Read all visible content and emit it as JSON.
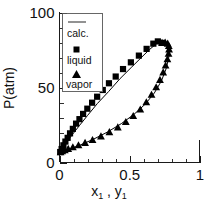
{
  "chart_data": {
    "type": "scatter",
    "title": "",
    "xlabel": "x₁ , y₁",
    "ylabel": "P(atm)",
    "xlim": [
      0,
      1
    ],
    "ylim": [
      0,
      100
    ],
    "xticks": [
      0,
      0.5,
      1
    ],
    "xtick_labels": [
      "0",
      "0.5",
      "1"
    ],
    "yticks": [
      0,
      50,
      100
    ],
    "ytick_labels": [
      "0",
      "50",
      "100"
    ],
    "x_minor_step": 0.1,
    "y_minor_step": 10,
    "grid": false,
    "legend_position": "upper-left-inside",
    "legend_entries": [
      {
        "label": "calc.",
        "marker": "line"
      },
      {
        "label": "liquid",
        "marker": "square"
      },
      {
        "label": "vapor",
        "marker": "triangle"
      }
    ],
    "series": [
      {
        "name": "liquid",
        "marker": "square",
        "x": [
          0.005,
          0.015,
          0.028,
          0.042,
          0.058,
          0.075,
          0.095,
          0.118,
          0.142,
          0.168,
          0.198,
          0.232,
          0.268,
          0.308,
          0.352,
          0.4,
          0.452,
          0.508,
          0.565,
          0.62,
          0.668,
          0.7,
          0.728
        ],
        "y": [
          7.0,
          9.0,
          11.5,
          14.0,
          16.5,
          19.5,
          22.5,
          26.0,
          29.0,
          32.5,
          36.0,
          40.0,
          44.0,
          48.5,
          53.0,
          57.5,
          62.5,
          67.0,
          71.5,
          76.0,
          79.5,
          81.0,
          80.0
        ]
      },
      {
        "name": "vapor",
        "marker": "triangle",
        "x": [
          0.008,
          0.02,
          0.038,
          0.062,
          0.095,
          0.135,
          0.182,
          0.235,
          0.295,
          0.355,
          0.415,
          0.472,
          0.525,
          0.575,
          0.618,
          0.655,
          0.688,
          0.715,
          0.738,
          0.755,
          0.768,
          0.776,
          0.78,
          0.778,
          0.77,
          0.752,
          0.73
        ],
        "y": [
          7.0,
          7.6,
          8.3,
          9.2,
          10.3,
          11.6,
          13.2,
          15.2,
          17.6,
          20.4,
          23.6,
          27.2,
          31.2,
          35.6,
          40.4,
          45.4,
          50.4,
          55.4,
          60.4,
          65.0,
          69.2,
          72.8,
          75.8,
          78.0,
          79.6,
          80.4,
          80.2
        ]
      }
    ],
    "calc_curves": [
      {
        "name": "liquid-calc",
        "x": [
          0.0,
          0.02,
          0.05,
          0.09,
          0.14,
          0.2,
          0.27,
          0.35,
          0.43,
          0.51,
          0.58,
          0.64,
          0.69,
          0.72,
          0.735
        ],
        "y": [
          6.5,
          9.5,
          13.5,
          18.5,
          24.5,
          31.5,
          39.5,
          47.5,
          56.0,
          63.5,
          70.0,
          75.5,
          79.5,
          81.0,
          80.5
        ]
      },
      {
        "name": "vapor-calc",
        "x": [
          0.0,
          0.03,
          0.08,
          0.15,
          0.24,
          0.34,
          0.44,
          0.53,
          0.61,
          0.675,
          0.725,
          0.76,
          0.778,
          0.782,
          0.775,
          0.755,
          0.735
        ],
        "y": [
          6.5,
          7.8,
          9.3,
          11.8,
          15.5,
          20.3,
          26.0,
          32.2,
          39.0,
          46.5,
          54.5,
          63.0,
          70.5,
          76.0,
          79.5,
          80.8,
          80.5
        ]
      }
    ]
  }
}
